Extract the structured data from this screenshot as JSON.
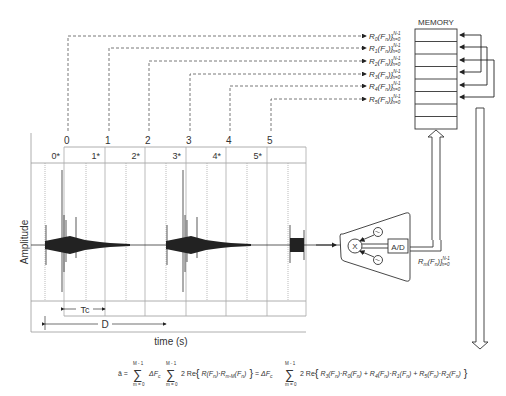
{
  "memory": {
    "title": "MEMORY",
    "rows": 8,
    "entries": [
      {
        "sub": "0",
        "label": "R",
        "arg": "(F",
        "argsub": "n",
        "close": ")}",
        "sup": "N - 1",
        "lower": "n = 0"
      },
      {
        "sub": "1",
        "label": "R",
        "arg": "(F",
        "argsub": "n",
        "close": ")}",
        "sup": "N - 1",
        "lower": "n = 0"
      },
      {
        "sub": "2",
        "label": "R",
        "arg": "(F",
        "argsub": "n",
        "close": ")}",
        "sup": "N - 1",
        "lower": "n = 0"
      },
      {
        "sub": "3",
        "label": "R",
        "arg": "(F",
        "argsub": "n",
        "close": ")}",
        "sup": "N - 1",
        "lower": "n = 0"
      },
      {
        "sub": "4",
        "label": "R",
        "arg": "(F",
        "argsub": "n",
        "close": ")}",
        "sup": "N - 1",
        "lower": "n = 0"
      },
      {
        "sub": "5",
        "label": "R",
        "arg": "(F",
        "argsub": "n",
        "close": ")}",
        "sup": "N - 1",
        "lower": "n = 0"
      }
    ]
  },
  "timeline": {
    "window_numbers": [
      "0",
      "1",
      "2",
      "3",
      "4",
      "5"
    ],
    "star_labels": [
      "0*",
      "1*",
      "2*",
      "3*",
      "4*",
      "5*"
    ],
    "y_axis_label": "Amplitude",
    "x_axis_label": "time (s)",
    "tc_label": "Tc",
    "d_label": "D"
  },
  "processor": {
    "mixer_label": "X",
    "adc_label": "A/D",
    "output_label": {
      "label": "R",
      "sub": "m",
      "arg": "(F",
      "argsub": "n",
      "close": ")}",
      "sup": "N - 1",
      "lower": "n = 0"
    }
  },
  "equation": {
    "lhs": "ā =",
    "sum1_top": "M - 1",
    "sum1_bottom": "m = 0",
    "delta": "ΔF",
    "delta_sub": "c",
    "sum2_top": "M - 1",
    "sum2_bottom": "m = 0",
    "body1": "2 Re{ R(F",
    "body1b": ")·R",
    "body1_sub": "m - M",
    "body1c": "(F",
    "body1d": ") }",
    "eq2": "= ΔF",
    "sum3_top": "M - 1",
    "sum3_bottom": "m = 0",
    "body2": "2 Re{ R",
    "terms": "R3(Fn)·R0(Fn) + R4(Fn)·R1(Fn) + R5(Fn)·R2(Fn)"
  }
}
